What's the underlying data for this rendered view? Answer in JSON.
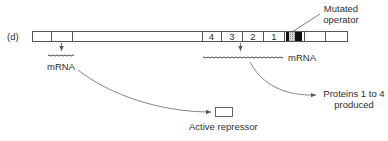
{
  "panel_label": "(d)",
  "operon": {
    "regulatory_segments": [
      "",
      ""
    ],
    "genes": [
      {
        "label": "4"
      },
      {
        "label": "3"
      },
      {
        "label": "2"
      },
      {
        "label": "1"
      }
    ],
    "operator_label_line1": "Mutated",
    "operator_label_line2": "operator"
  },
  "left_transcript": {
    "mrna_label": "mRNA",
    "product_label": "Active repressor"
  },
  "right_transcript": {
    "mrna_label": "mRNA",
    "product_label_line1": "Proteins 1 to 4",
    "product_label_line2": "produced"
  },
  "colors": {
    "line": "#555555",
    "operator_black": "#111111",
    "operator_grey": "#b8b8b8",
    "text": "#2e2e2e"
  }
}
